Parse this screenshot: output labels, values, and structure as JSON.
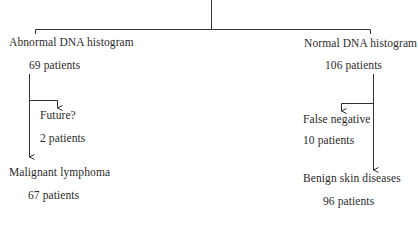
{
  "diagram": {
    "type": "flowchart",
    "root": {
      "label": ""
    },
    "branches": {
      "abnormal": {
        "title": "Abnormal DNA histogram",
        "count": "69 patients",
        "children": {
          "future": {
            "title": "Future?",
            "count": "2 patients"
          },
          "lymphoma": {
            "title": "Malignant lymphoma",
            "count": "67 patients"
          }
        }
      },
      "normal": {
        "title": "Normal DNA histogram",
        "count": "106 patients",
        "children": {
          "false_negative": {
            "title": "False negative",
            "count": "10 patients"
          },
          "benign": {
            "title": "Benign skin diseases",
            "count": "96 patients"
          }
        }
      }
    },
    "colors": {
      "line": "#333333",
      "text": "#2a2a2a",
      "background": "#ffffff"
    }
  }
}
